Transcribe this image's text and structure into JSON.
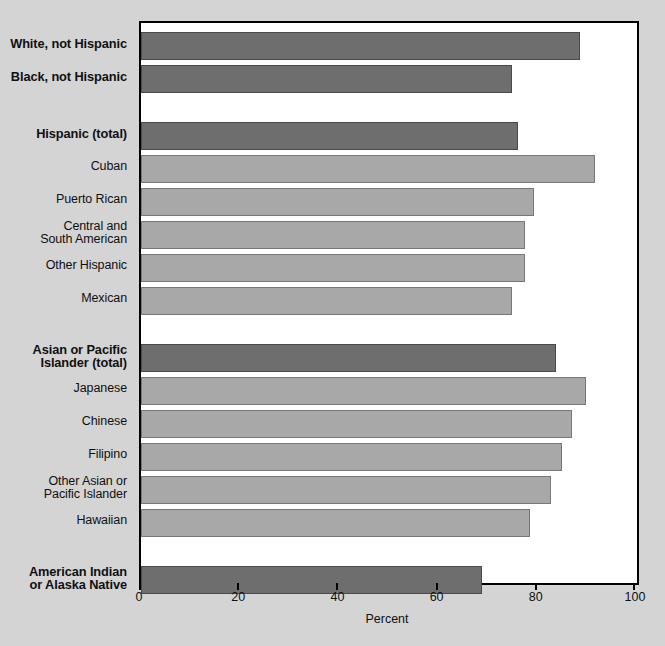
{
  "chart_data": {
    "type": "bar",
    "orientation": "horizontal",
    "title": "",
    "xlabel": "Percent",
    "ylabel": "",
    "xlim": [
      0,
      100
    ],
    "xticks": [
      0,
      20,
      40,
      60,
      80,
      100
    ],
    "xtick_labels": [
      "0",
      "20",
      "40",
      "60",
      "80",
      "100"
    ],
    "grid": false,
    "legend": false,
    "colors": {
      "total_bar": "#6e6e6e",
      "subgroup_bar": "#a8a8a8",
      "plot_background": "#ffffff",
      "page_background": "#d4d4d4",
      "frame": "#000000",
      "text": "#101010"
    },
    "groups": [
      {
        "name": "white-black",
        "items": [
          {
            "label": "White, not Hispanic",
            "value": 88.5,
            "emphasis": "total"
          },
          {
            "label": "Black, not Hispanic",
            "value": 74.8,
            "emphasis": "total"
          }
        ]
      },
      {
        "name": "hispanic",
        "items": [
          {
            "label": "Hispanic (total)",
            "value": 76.0,
            "emphasis": "total"
          },
          {
            "label": "Cuban",
            "value": 91.5,
            "emphasis": "subgroup"
          },
          {
            "label": "Puerto Rican",
            "value": 79.2,
            "emphasis": "subgroup"
          },
          {
            "label": "Central and\nSouth American",
            "value": 77.4,
            "emphasis": "subgroup"
          },
          {
            "label": "Other Hispanic",
            "value": 77.4,
            "emphasis": "subgroup"
          },
          {
            "label": "Mexican",
            "value": 74.8,
            "emphasis": "subgroup"
          }
        ]
      },
      {
        "name": "asian-pacific-islander",
        "items": [
          {
            "label": "Asian or Pacific\nIslander (total)",
            "value": 83.7,
            "emphasis": "total"
          },
          {
            "label": "Japanese",
            "value": 89.7,
            "emphasis": "subgroup"
          },
          {
            "label": "Chinese",
            "value": 86.9,
            "emphasis": "subgroup"
          },
          {
            "label": "Filipino",
            "value": 84.9,
            "emphasis": "subgroup"
          },
          {
            "label": "Other Asian or\nPacific Islander",
            "value": 82.7,
            "emphasis": "subgroup"
          },
          {
            "label": "Hawaiian",
            "value": 78.4,
            "emphasis": "subgroup"
          }
        ]
      },
      {
        "name": "american-indian",
        "items": [
          {
            "label": "American Indian\nor Alaska Native",
            "value": 68.8,
            "emphasis": "total"
          }
        ]
      }
    ]
  }
}
